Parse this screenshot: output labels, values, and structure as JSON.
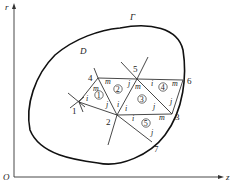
{
  "figure": {
    "axes": {
      "origin": "O",
      "vertical": "r",
      "horizontal": "z"
    },
    "region_label": "D",
    "boundary_label": "Γ",
    "nodes": [
      {
        "id": "1",
        "x": 79,
        "y": 102,
        "lx": 72,
        "ly": 113
      },
      {
        "id": "2",
        "x": 117,
        "y": 115,
        "lx": 106,
        "ly": 124
      },
      {
        "id": "3",
        "x": 172,
        "y": 114,
        "lx": 175,
        "ly": 119
      },
      {
        "id": "4",
        "x": 98,
        "y": 78,
        "lx": 88,
        "ly": 81
      },
      {
        "id": "5",
        "x": 137,
        "y": 79,
        "lx": 133,
        "ly": 72
      },
      {
        "id": "6",
        "x": 183,
        "y": 80,
        "lx": 187,
        "ly": 84
      },
      {
        "id": "7",
        "x": 152,
        "y": 142,
        "lx": 154,
        "ly": 151
      }
    ],
    "elements": [
      {
        "id": "1",
        "cx": 99,
        "cy": 98
      },
      {
        "id": "2",
        "cx": 118,
        "cy": 90
      },
      {
        "id": "3",
        "cx": 142,
        "cy": 100
      },
      {
        "id": "4",
        "cx": 163,
        "cy": 87
      },
      {
        "id": "5",
        "cx": 146,
        "cy": 123
      }
    ],
    "local_labels": [
      {
        "t": "m",
        "x": 93,
        "y": 91
      },
      {
        "t": "i",
        "x": 86,
        "y": 101
      },
      {
        "t": "j",
        "x": 106,
        "y": 107
      },
      {
        "t": "m",
        "x": 105,
        "y": 85
      },
      {
        "t": "j",
        "x": 128,
        "y": 86
      },
      {
        "t": "i",
        "x": 117,
        "y": 106
      },
      {
        "t": "m",
        "x": 135,
        "y": 89
      },
      {
        "t": "i",
        "x": 125,
        "y": 110
      },
      {
        "t": "j",
        "x": 153,
        "y": 109
      },
      {
        "t": "i",
        "x": 151,
        "y": 86
      },
      {
        "t": "m",
        "x": 173,
        "y": 86
      },
      {
        "t": "j",
        "x": 170,
        "y": 103
      },
      {
        "t": "i",
        "x": 132,
        "y": 120
      },
      {
        "t": "m",
        "x": 160,
        "y": 120
      },
      {
        "t": "j",
        "x": 151,
        "y": 134
      }
    ]
  }
}
